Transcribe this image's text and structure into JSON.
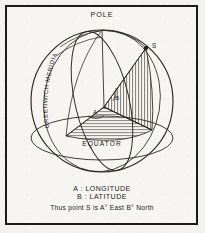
{
  "figure": {
    "title_label": "POLE",
    "equator_label": "EQUATOR",
    "meridian_label": "GREENWICH MERIDIAN",
    "point_label": "S",
    "angle_longitude_label": "A",
    "angle_latitude_label": "B",
    "colors": {
      "ink": "#1c1a18",
      "line": "#2a2723",
      "paper": "#f7f5f1",
      "frame": "#1c1a18"
    }
  },
  "caption": {
    "line1": "A : LONGITUDE",
    "line2": "B : LATITUDE",
    "line3": "Thus point S is A° East  B° North"
  }
}
